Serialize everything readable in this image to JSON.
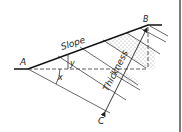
{
  "figure": {
    "type": "geology-thickness-diagram",
    "labels": {
      "point_a": "A",
      "point_b": "B",
      "point_c": "C",
      "slope": "Slope",
      "thickness": "Thickness",
      "angle_x": "x",
      "angle_y": "y"
    },
    "colors": {
      "line": "#222222",
      "stipple": "#888888",
      "background": "#ffffff"
    }
  }
}
